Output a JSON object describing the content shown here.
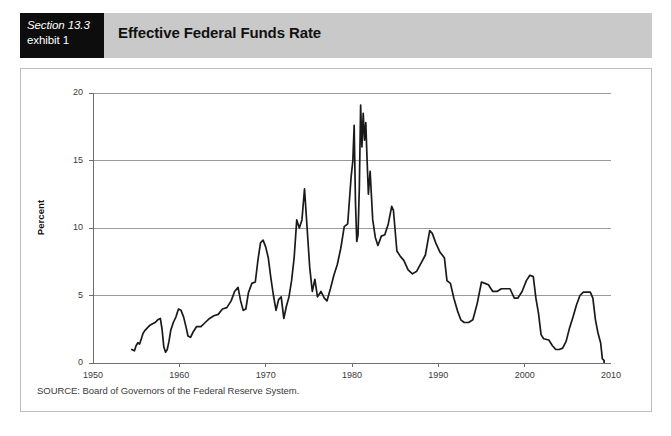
{
  "header": {
    "section_label": "Section 13.3",
    "exhibit_label": "exhibit 1",
    "title": "Effective Federal Funds Rate",
    "band_color": "#c9c9c9",
    "box_color": "#0d0d0d"
  },
  "source": {
    "text": "SOURCE: Board of Governors of the Federal Reserve System."
  },
  "chart_data": {
    "type": "line",
    "title": "Effective Federal Funds Rate",
    "xlabel": "",
    "ylabel": "Percent",
    "xlim": [
      1950,
      2010
    ],
    "ylim": [
      0,
      20
    ],
    "xticks": [
      1950,
      1960,
      1970,
      1980,
      1990,
      2000,
      2010
    ],
    "xtick_labels": [
      "1950",
      "1960",
      "1970",
      "1980",
      "1990",
      "2000",
      "2010"
    ],
    "yticks": [
      0,
      5,
      10,
      15,
      20
    ],
    "ytick_labels": [
      "0",
      "5",
      "10",
      "15",
      "20"
    ],
    "grid": "horizontal",
    "legend": "none",
    "line_color": "#1a1a1a",
    "grid_color": "#9a9a9a",
    "axis_color": "#6e6e6e",
    "series": [
      {
        "name": "Effective Federal Funds Rate",
        "x": [
          1954.5,
          1954.8,
          1955.0,
          1955.2,
          1955.4,
          1955.6,
          1955.8,
          1956.0,
          1956.3,
          1956.6,
          1956.9,
          1957.2,
          1957.5,
          1957.8,
          1958.0,
          1958.2,
          1958.4,
          1958.6,
          1958.8,
          1959.0,
          1959.3,
          1959.6,
          1959.9,
          1960.2,
          1960.5,
          1960.8,
          1961.0,
          1961.3,
          1961.6,
          1962.0,
          1962.5,
          1963.0,
          1963.5,
          1964.0,
          1964.5,
          1965.0,
          1965.5,
          1966.0,
          1966.4,
          1966.8,
          1967.1,
          1967.4,
          1967.7,
          1968.0,
          1968.4,
          1968.8,
          1969.1,
          1969.4,
          1969.7,
          1970.0,
          1970.3,
          1970.6,
          1970.9,
          1971.2,
          1971.5,
          1971.8,
          1972.1,
          1972.4,
          1972.7,
          1973.0,
          1973.3,
          1973.6,
          1973.9,
          1974.2,
          1974.5,
          1974.8,
          1975.1,
          1975.4,
          1975.7,
          1976.0,
          1976.4,
          1976.8,
          1977.1,
          1977.5,
          1977.9,
          1978.3,
          1978.7,
          1979.1,
          1979.5,
          1979.9,
          1980.1,
          1980.25,
          1980.4,
          1980.55,
          1980.7,
          1980.85,
          1981.0,
          1981.15,
          1981.3,
          1981.45,
          1981.6,
          1981.75,
          1981.9,
          1982.1,
          1982.4,
          1982.7,
          1983.0,
          1983.4,
          1983.8,
          1984.2,
          1984.6,
          1984.8,
          1985.2,
          1985.6,
          1986.0,
          1986.5,
          1987.0,
          1987.5,
          1988.0,
          1988.5,
          1989.0,
          1989.3,
          1989.7,
          1990.2,
          1990.7,
          1991.0,
          1991.4,
          1991.8,
          1992.2,
          1992.6,
          1993.0,
          1993.5,
          1994.0,
          1994.5,
          1995.0,
          1995.4,
          1995.8,
          1996.3,
          1996.8,
          1997.3,
          1997.8,
          1998.3,
          1998.8,
          1999.2,
          1999.7,
          2000.2,
          2000.6,
          2001.0,
          2001.3,
          2001.6,
          2001.9,
          2002.2,
          2002.8,
          2003.2,
          2003.6,
          2004.0,
          2004.4,
          2004.8,
          2005.2,
          2005.6,
          2006.0,
          2006.4,
          2006.8,
          2007.2,
          2007.6,
          2007.9,
          2008.2,
          2008.5,
          2008.8,
          2009.0,
          2009.2
        ],
        "y": [
          1.0,
          0.9,
          1.3,
          1.5,
          1.4,
          1.8,
          2.2,
          2.4,
          2.6,
          2.8,
          2.9,
          3.0,
          3.2,
          3.3,
          2.5,
          1.2,
          0.8,
          1.0,
          1.6,
          2.4,
          3.0,
          3.4,
          4.0,
          3.9,
          3.4,
          2.6,
          2.0,
          1.9,
          2.3,
          2.7,
          2.7,
          3.0,
          3.3,
          3.5,
          3.6,
          4.0,
          4.1,
          4.6,
          5.3,
          5.6,
          4.6,
          3.9,
          4.0,
          5.2,
          5.9,
          6.0,
          7.6,
          8.9,
          9.1,
          8.6,
          7.8,
          6.3,
          5.0,
          3.9,
          4.7,
          4.9,
          3.3,
          4.2,
          4.9,
          6.1,
          7.8,
          10.6,
          10.0,
          10.6,
          12.9,
          10.0,
          7.1,
          5.3,
          6.2,
          4.9,
          5.3,
          4.8,
          4.6,
          5.5,
          6.5,
          7.3,
          8.5,
          10.1,
          10.3,
          13.8,
          15.0,
          17.6,
          12.0,
          9.0,
          9.5,
          13.0,
          19.1,
          16.0,
          18.5,
          16.5,
          17.8,
          15.0,
          12.5,
          14.2,
          10.6,
          9.3,
          8.7,
          9.4,
          9.5,
          10.3,
          11.6,
          11.3,
          8.3,
          7.9,
          7.6,
          6.9,
          6.6,
          6.8,
          7.4,
          8.0,
          9.8,
          9.6,
          8.9,
          8.2,
          7.8,
          6.1,
          5.9,
          4.8,
          3.9,
          3.2,
          3.0,
          3.0,
          3.2,
          4.4,
          6.0,
          5.9,
          5.8,
          5.3,
          5.3,
          5.5,
          5.5,
          5.5,
          4.8,
          4.8,
          5.3,
          6.1,
          6.5,
          6.4,
          4.8,
          3.7,
          2.1,
          1.8,
          1.7,
          1.3,
          1.0,
          1.0,
          1.1,
          1.6,
          2.6,
          3.4,
          4.3,
          5.0,
          5.25,
          5.25,
          5.25,
          4.8,
          3.2,
          2.2,
          1.5,
          0.3,
          0.2
        ]
      }
    ],
    "annotations": [
      {
        "label": "1969-70 peak",
        "value": 9.1
      },
      {
        "label": "1974 peak",
        "value": 12.9
      },
      {
        "label": "1981 peak",
        "value": 19.1
      },
      {
        "label": "1984 peak",
        "value": 11.6
      },
      {
        "label": "1989 peak",
        "value": 9.8
      },
      {
        "label": "2000 peak",
        "value": 6.5
      },
      {
        "label": "2003-04 trough",
        "value": 1.0
      },
      {
        "label": "2009 trough",
        "value": 0.2
      }
    ]
  }
}
